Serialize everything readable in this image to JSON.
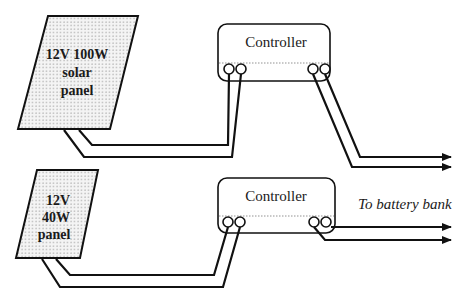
{
  "diagram": {
    "type": "solar-wiring-schematic",
    "colors": {
      "line": "#111111",
      "panel_fill": "#eeeeee",
      "background": "#ffffff"
    },
    "systems": [
      {
        "panel": {
          "label_lines": [
            "12V 100W",
            "solar",
            "panel"
          ]
        },
        "controller": {
          "label": "Controller"
        },
        "outputs": 2
      },
      {
        "panel": {
          "label_lines": [
            "12V",
            "40W",
            "panel"
          ]
        },
        "controller": {
          "label": "Controller"
        },
        "outputs": 2
      }
    ],
    "annotation": "To battery bank"
  }
}
